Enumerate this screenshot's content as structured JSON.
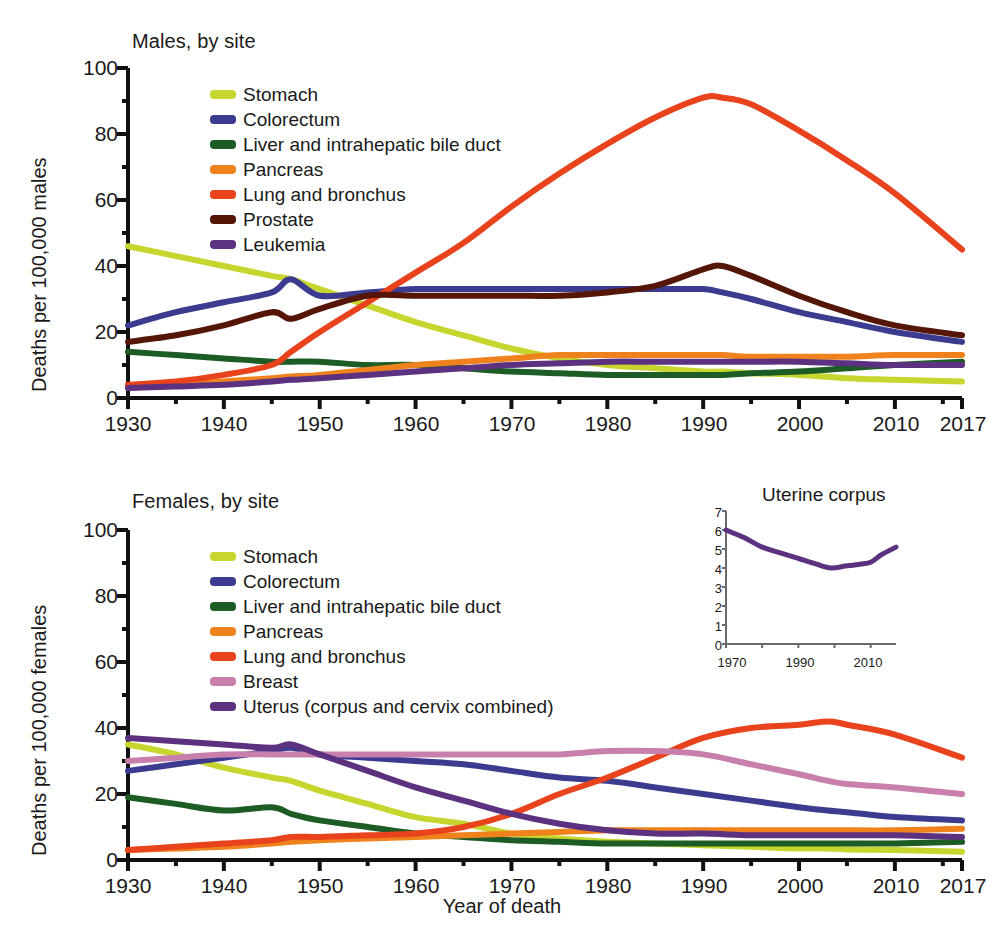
{
  "figure": {
    "xlabel": "Year of death"
  },
  "panels": [
    {
      "id": "males",
      "title": "Males, by site",
      "ylabel": "Deaths per 100,000 males",
      "ytick_labels": [
        "100",
        "80",
        "60",
        "40",
        "20",
        "0"
      ],
      "xtick_labels": [
        "1930",
        "1940",
        "1950",
        "1960",
        "1970",
        "1980",
        "1990",
        "2000",
        "2010",
        "2017"
      ],
      "legend": [
        {
          "label": "Stomach",
          "color": "#c6d62e"
        },
        {
          "label": "Colorectum",
          "color": "#3b3b8f"
        },
        {
          "label": "Liver and intrahepatic bile duct",
          "color": "#1d5c24"
        },
        {
          "label": "Pancreas",
          "color": "#f0821e"
        },
        {
          "label": "Lung and bronchus",
          "color": "#e8431c"
        },
        {
          "label": "Prostate",
          "color": "#551608"
        },
        {
          "label": "Leukemia",
          "color": "#5b3180"
        }
      ]
    },
    {
      "id": "females",
      "title": "Females, by site",
      "ylabel": "Deaths per 100,000 females",
      "ytick_labels": [
        "100",
        "80",
        "60",
        "40",
        "20",
        "0"
      ],
      "xtick_labels": [
        "1930",
        "1940",
        "1950",
        "1960",
        "1970",
        "1980",
        "1990",
        "2000",
        "2010",
        "2017"
      ],
      "legend": [
        {
          "label": "Stomach",
          "color": "#c6d62e"
        },
        {
          "label": "Colorectum",
          "color": "#3b3b8f"
        },
        {
          "label": "Liver and intrahepatic bile duct",
          "color": "#1d5c24"
        },
        {
          "label": "Pancreas",
          "color": "#f0821e"
        },
        {
          "label": "Lung and bronchus",
          "color": "#e8431c"
        },
        {
          "label": "Breast",
          "color": "#c97fab"
        },
        {
          "label": "Uterus (corpus and cervix combined)",
          "color": "#5b3180"
        }
      ],
      "inset": {
        "title": "Uterine corpus",
        "ytick_labels": [
          "7",
          "6",
          "5",
          "4",
          "3",
          "2",
          "1",
          "0"
        ],
        "xtick_labels": [
          "1970",
          "1990",
          "2010"
        ],
        "line_color": "#5b3180"
      }
    }
  ],
  "chart_data": [
    {
      "type": "line",
      "title": "Males, by site",
      "xlabel": "Year of death",
      "ylabel": "Deaths per 100,000 males",
      "xlim": [
        1930,
        2017
      ],
      "ylim": [
        0,
        100
      ],
      "yticks": [
        0,
        20,
        40,
        60,
        80,
        100
      ],
      "xticks": [
        1930,
        1940,
        1950,
        1960,
        1970,
        1980,
        1990,
        2000,
        2010,
        2017
      ],
      "grid": false,
      "legend_position": "upper-left-inside",
      "x": [
        1930,
        1935,
        1940,
        1945,
        1947,
        1950,
        1955,
        1960,
        1965,
        1970,
        1975,
        1980,
        1985,
        1990,
        1992,
        1995,
        2000,
        2005,
        2010,
        2017
      ],
      "series": [
        {
          "name": "Stomach",
          "color": "#c6d62e",
          "values": [
            46,
            43,
            40,
            37,
            36,
            33,
            28,
            23,
            19,
            15,
            12,
            10,
            9,
            8,
            8,
            7.5,
            7,
            6,
            5.5,
            5
          ]
        },
        {
          "name": "Colorectum",
          "color": "#3b3b8f",
          "values": [
            22,
            26,
            29,
            32,
            36,
            31,
            32,
            33,
            33,
            33,
            33,
            33,
            33,
            33,
            32,
            30,
            26,
            23,
            20,
            17
          ]
        },
        {
          "name": "Liver and intrahepatic bile duct",
          "color": "#1d5c24",
          "values": [
            14,
            13,
            12,
            11,
            11,
            11,
            10,
            10,
            9,
            8,
            7.5,
            7,
            7,
            7,
            7,
            7.5,
            8,
            9,
            10,
            11
          ]
        },
        {
          "name": "Pancreas",
          "color": "#f0821e",
          "values": [
            3,
            4,
            5,
            6,
            6.5,
            7,
            8.5,
            10,
            11,
            12,
            13,
            13,
            13,
            13,
            13,
            12.5,
            12.5,
            12.5,
            13,
            13
          ]
        },
        {
          "name": "Lung and bronchus",
          "color": "#e8431c",
          "values": [
            4,
            5,
            7,
            10,
            14,
            20,
            29,
            38,
            47,
            58,
            68,
            77,
            85,
            91,
            91,
            89,
            81,
            72,
            62,
            45
          ]
        },
        {
          "name": "Prostate",
          "color": "#551608",
          "values": [
            17,
            19,
            22,
            26,
            24,
            27,
            31,
            31,
            31,
            31,
            31,
            32,
            34,
            39,
            40,
            37,
            31,
            26,
            22,
            19
          ]
        },
        {
          "name": "Leukemia",
          "color": "#5b3180",
          "values": [
            3,
            3.5,
            4,
            5,
            5.5,
            6,
            7,
            8,
            9,
            10,
            10.5,
            11,
            11,
            11,
            11,
            11,
            11,
            10.5,
            10,
            10
          ]
        }
      ]
    },
    {
      "type": "line",
      "title": "Females, by site",
      "xlabel": "Year of death",
      "ylabel": "Deaths per 100,000 females",
      "xlim": [
        1930,
        2017
      ],
      "ylim": [
        0,
        100
      ],
      "yticks": [
        0,
        20,
        40,
        60,
        80,
        100
      ],
      "xticks": [
        1930,
        1940,
        1950,
        1960,
        1970,
        1980,
        1990,
        2000,
        2010,
        2017
      ],
      "grid": false,
      "legend_position": "upper-left-inside",
      "x": [
        1930,
        1935,
        1940,
        1945,
        1947,
        1950,
        1955,
        1960,
        1965,
        1970,
        1975,
        1980,
        1985,
        1990,
        1995,
        2000,
        2003,
        2005,
        2010,
        2017
      ],
      "series": [
        {
          "name": "Stomach",
          "color": "#c6d62e",
          "values": [
            35,
            32,
            28,
            25,
            24,
            21,
            17,
            13,
            11,
            8,
            6.5,
            5.5,
            5,
            4.5,
            4,
            3.5,
            3.5,
            3.2,
            3,
            2.5
          ]
        },
        {
          "name": "Colorectum",
          "color": "#3b3b8f",
          "values": [
            27,
            29,
            31,
            33,
            34,
            32,
            31,
            30,
            29,
            27,
            25,
            24,
            22,
            20,
            18,
            16,
            15,
            14.5,
            13,
            12
          ]
        },
        {
          "name": "Liver and intrahepatic bile duct",
          "color": "#1d5c24",
          "values": [
            19,
            17,
            15,
            16,
            14,
            12,
            10,
            8,
            7,
            6,
            5.5,
            5,
            5,
            5,
            5,
            5,
            5,
            5,
            5,
            5.5
          ]
        },
        {
          "name": "Pancreas",
          "color": "#f0821e",
          "values": [
            3,
            3.5,
            4,
            5,
            5.5,
            6,
            6.5,
            7,
            7.5,
            8,
            8.5,
            9,
            9,
            9,
            9,
            9,
            9,
            9,
            9,
            9.5
          ]
        },
        {
          "name": "Lung and bronchus",
          "color": "#e8431c",
          "values": [
            3,
            4,
            5,
            6,
            7,
            7,
            7.5,
            8,
            10,
            14,
            20,
            25,
            31,
            37,
            40,
            41,
            42,
            41,
            38,
            31
          ]
        },
        {
          "name": "Breast",
          "color": "#c97fab",
          "values": [
            30,
            31,
            32,
            32,
            32,
            32,
            32,
            32,
            32,
            32,
            32,
            33,
            33,
            32,
            29,
            26,
            24,
            23,
            22,
            20
          ]
        },
        {
          "name": "Uterus (corpus and cervix combined)",
          "color": "#5b3180",
          "values": [
            37,
            36,
            35,
            34,
            35,
            32,
            27,
            22,
            18,
            14,
            11,
            9,
            8,
            8,
            7.5,
            7.5,
            7.5,
            7.5,
            7.5,
            7
          ]
        }
      ]
    },
    {
      "type": "line",
      "title": "Uterine corpus",
      "xlabel": "",
      "ylabel": "",
      "xlim": [
        1970,
        2017
      ],
      "ylim": [
        0,
        7
      ],
      "yticks": [
        0,
        1,
        2,
        3,
        4,
        5,
        6,
        7
      ],
      "xticks": [
        1970,
        1990,
        2010
      ],
      "grid": false,
      "x": [
        1970,
        1975,
        1980,
        1985,
        1990,
        1995,
        1999,
        2003,
        2007,
        2010,
        2013,
        2017
      ],
      "series": [
        {
          "name": "Uterine corpus",
          "color": "#5b3180",
          "values": [
            6.0,
            5.6,
            5.1,
            4.8,
            4.5,
            4.2,
            4.0,
            4.1,
            4.2,
            4.3,
            4.7,
            5.1
          ]
        }
      ]
    }
  ]
}
